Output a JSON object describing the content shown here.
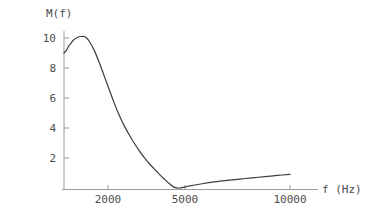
{
  "chart_data": {
    "type": "line",
    "title": "",
    "subtitle": "",
    "xlabel": "f (Hz)",
    "ylabel": "M(f)",
    "xlim": [
      1000,
      10000
    ],
    "ylim": [
      0,
      10.6
    ],
    "xticks": [
      2000,
      5000,
      10000
    ],
    "xtick_labels": [
      "2000",
      "5000",
      "10000"
    ],
    "yticks": [
      2,
      4,
      6,
      8,
      10
    ],
    "ytick_labels": [
      "2",
      "4",
      "6",
      "8",
      "10"
    ],
    "grid": false,
    "legend": null,
    "legend_position": "none",
    "line_color": "#3c3c3c",
    "axis_color": "#9a9a9a",
    "background_color": "#ffffff",
    "series": [
      {
        "name": "M(f)",
        "x": [
          1000,
          1100,
          1200,
          1300,
          1400,
          1500,
          1600,
          1700,
          1800,
          1900,
          2000,
          2200,
          2400,
          2600,
          2800,
          3000,
          3200,
          3400,
          3600,
          3800,
          4000,
          4200,
          4400,
          4600,
          4800,
          5000,
          5200,
          5400,
          5600,
          5800,
          6000,
          6500,
          7000,
          7500,
          8000,
          8500,
          9000,
          9500,
          10000
        ],
        "y": [
          9.0,
          9.2,
          9.5,
          9.7,
          9.9,
          10.0,
          10.08,
          10.1,
          10.1,
          10.0,
          9.8,
          9.2,
          8.4,
          7.5,
          6.6,
          5.7,
          4.9,
          4.2,
          3.6,
          3.05,
          2.55,
          2.1,
          1.7,
          1.35,
          1.0,
          0.68,
          0.38,
          0.14,
          0.1,
          0.16,
          0.24,
          0.38,
          0.5,
          0.6,
          0.69,
          0.77,
          0.85,
          0.93,
          1.0
        ]
      }
    ],
    "annotations": []
  }
}
